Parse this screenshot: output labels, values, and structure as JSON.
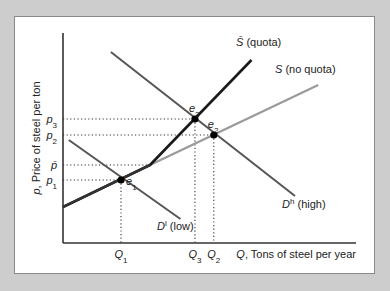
{
  "chart_data": {
    "type": "line",
    "title": "",
    "xlabel": "Q, Tons of steel per year",
    "ylabel": "p, Price of steel per ton",
    "xlim": [
      0,
      100
    ],
    "ylim": [
      0,
      100
    ],
    "grid": false,
    "x_ticks": [
      {
        "label": "Q",
        "sub": "1",
        "value": 20
      },
      {
        "label": "Q",
        "sub": "3",
        "value": 45.5
      },
      {
        "label": "Q",
        "sub": "2",
        "value": 52
      }
    ],
    "y_ticks": [
      {
        "label": "p",
        "sub": "3",
        "value": 62
      },
      {
        "label": "p",
        "sub": "2",
        "value": 54
      },
      {
        "label": "p̄",
        "sub": "",
        "value": 39
      },
      {
        "label": "p",
        "sub": "1",
        "value": 31.5
      }
    ],
    "series": [
      {
        "name": "S (no quota)",
        "label_main": "S",
        "label_rest": " (no quota)",
        "color": "#9a9a9a",
        "points": [
          [
            0,
            18
          ],
          [
            30,
            39
          ],
          [
            88,
            79
          ]
        ]
      },
      {
        "name": "S̄ (quota)",
        "label_main": "S̄",
        "label_rest": " (quota)",
        "color": "#1a1a1a",
        "points": [
          [
            0,
            18
          ],
          [
            30,
            39
          ],
          [
            65,
            91.5
          ]
        ]
      },
      {
        "name": "Dʰ (high)",
        "label_main": "D",
        "label_sup": "h",
        "label_rest": " (high)",
        "color": "#555555",
        "points": [
          [
            16.5,
            95.5
          ],
          [
            80,
            23.5
          ]
        ]
      },
      {
        "name": "Dˡ (low)",
        "label_main": "D",
        "label_sup": "l",
        "label_rest": " (low)",
        "color": "#555555",
        "points": [
          [
            2,
            51.5
          ],
          [
            40.5,
            12
          ]
        ]
      }
    ],
    "equilibria": [
      {
        "name": "e1",
        "label": "e",
        "sub": "1",
        "x": 20,
        "y": 31.5
      },
      {
        "name": "e3",
        "label": "e",
        "sub": "3",
        "x": 45.5,
        "y": 62
      },
      {
        "name": "e2",
        "label": "e",
        "sub": "2",
        "x": 52,
        "y": 54
      }
    ]
  }
}
